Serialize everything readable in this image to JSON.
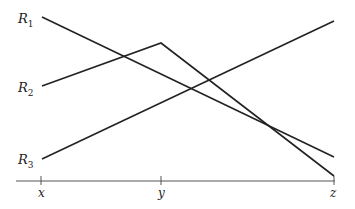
{
  "diagram": {
    "type": "line-diagram",
    "colors": {
      "line": "#222222",
      "background": "#ffffff"
    },
    "axis": {
      "ticks": [
        {
          "label": "x",
          "x": 41
        },
        {
          "label": "y",
          "x": 161
        },
        {
          "label": "z",
          "x": 334
        }
      ]
    },
    "lines": [
      {
        "label": "R",
        "sub": "1",
        "from": [
          42,
          17
        ],
        "to": [
          334,
          157
        ]
      },
      {
        "label": "R",
        "sub": "2",
        "from": [
          42,
          86
        ],
        "via": [
          161,
          43
        ],
        "to": [
          334,
          176
        ]
      },
      {
        "label": "R",
        "sub": "3",
        "from": [
          42,
          159
        ],
        "to": [
          334,
          21
        ]
      }
    ]
  }
}
